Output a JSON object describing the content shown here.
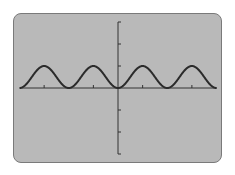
{
  "chart_data": {
    "type": "line",
    "title": "",
    "xlabel": "",
    "ylabel": "",
    "function": "y = sin^2(x)",
    "series": [
      {
        "name": "curve",
        "x": [
          -8,
          -6,
          -4,
          -2,
          0,
          2,
          4,
          6,
          8
        ],
        "values": [
          0,
          1,
          0,
          1,
          0,
          1,
          0,
          1,
          0
        ]
      }
    ],
    "x_ticks": [
      -6,
      -2,
      2,
      6
    ],
    "y_ticks": [
      -3,
      -2,
      -1,
      1,
      2,
      3
    ],
    "xlim": [
      -8,
      8
    ],
    "ylim": [
      -3,
      3
    ],
    "grid": false,
    "legend": "none"
  },
  "colors": {
    "screen_bg": "#b9b9b9",
    "border": "#7a7a7a",
    "curve": "#2b2b2b",
    "axes": "#333333"
  }
}
